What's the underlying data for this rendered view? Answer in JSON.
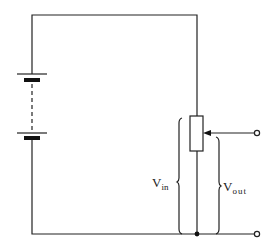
{
  "diagram": {
    "type": "potential-divider-circuit",
    "components": {
      "battery": {
        "name": "battery",
        "cells_shown": 2,
        "dashed_between": true
      },
      "potentiometer": {
        "name": "potentiometer",
        "has_wiper": true
      },
      "terminals": [
        {
          "name": "output-terminal-top"
        },
        {
          "name": "output-terminal-bottom"
        }
      ],
      "junction": {
        "name": "junction-dot"
      }
    },
    "labels": {
      "vin": {
        "main": "V",
        "sub": "in"
      },
      "vout": {
        "main": "V",
        "sub": "out"
      }
    },
    "colors": {
      "line": "#222222",
      "background": "#ffffff"
    }
  }
}
